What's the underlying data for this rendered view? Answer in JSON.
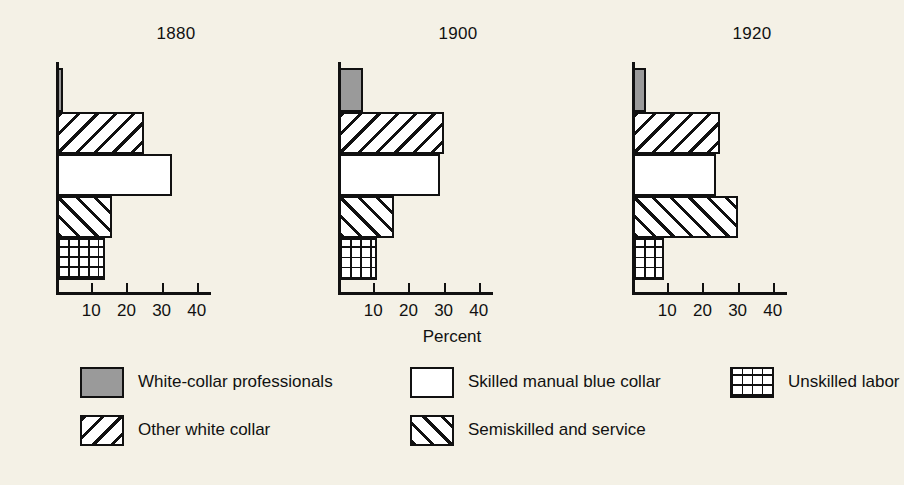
{
  "chart_data": {
    "type": "bar",
    "title": "",
    "xlabel": "Percent",
    "ylabel": "",
    "orientation": "horizontal",
    "grid": false,
    "legend_position": "bottom",
    "xlim": [
      0,
      45
    ],
    "xticks": [
      10,
      20,
      30,
      40
    ],
    "xtick_labels": [
      "10",
      "20",
      "30",
      "40"
    ],
    "panels": [
      "1880",
      "1900",
      "1920"
    ],
    "categories": [
      "White-collar professionals",
      "Other white collar",
      "Skilled manual blue collar",
      "Semiskilled and service",
      "Unskilled labor"
    ],
    "series": [
      {
        "name": "1880",
        "values": [
          2,
          25,
          33,
          16,
          14
        ]
      },
      {
        "name": "1900",
        "values": [
          7,
          30,
          29,
          16,
          11
        ]
      },
      {
        "name": "1920",
        "values": [
          4,
          25,
          24,
          30,
          9
        ]
      }
    ]
  },
  "panels": [
    {
      "title": "1880",
      "bars": [
        {
          "label": "White-collar professionals",
          "value": 2,
          "pattern": "solid-gray"
        },
        {
          "label": "Other white collar",
          "value": 25,
          "pattern": "backslash"
        },
        {
          "label": "Skilled manual blue collar",
          "value": 33,
          "pattern": "white"
        },
        {
          "label": "Semiskilled and service",
          "value": 16,
          "pattern": "forwardslash"
        },
        {
          "label": "Unskilled labor",
          "value": 14,
          "pattern": "grid"
        }
      ]
    },
    {
      "title": "1900",
      "bars": [
        {
          "label": "White-collar professionals",
          "value": 7,
          "pattern": "solid-gray"
        },
        {
          "label": "Other white collar",
          "value": 30,
          "pattern": "backslash"
        },
        {
          "label": "Skilled manual blue collar",
          "value": 29,
          "pattern": "white"
        },
        {
          "label": "Semiskilled and service",
          "value": 16,
          "pattern": "forwardslash"
        },
        {
          "label": "Unskilled labor",
          "value": 11,
          "pattern": "grid"
        }
      ]
    },
    {
      "title": "1920",
      "bars": [
        {
          "label": "White-collar professionals",
          "value": 4,
          "pattern": "solid-gray"
        },
        {
          "label": "Other white collar",
          "value": 25,
          "pattern": "backslash"
        },
        {
          "label": "Skilled manual blue collar",
          "value": 24,
          "pattern": "white"
        },
        {
          "label": "Semiskilled and service",
          "value": 30,
          "pattern": "forwardslash"
        },
        {
          "label": "Unskilled labor",
          "value": 9,
          "pattern": "grid"
        }
      ]
    }
  ],
  "axis": {
    "tick_values": [
      10,
      20,
      30,
      40
    ],
    "tick_labels": [
      "10",
      "20",
      "30",
      "40"
    ],
    "xlabel": "Percent"
  },
  "legend": {
    "rows": [
      [
        {
          "label": "White-collar professionals",
          "pattern": "solid-gray"
        },
        {
          "label": "Skilled manual blue collar",
          "pattern": "white"
        },
        {
          "label": "Unskilled labor",
          "pattern": "grid"
        }
      ],
      [
        {
          "label": "Other white collar",
          "pattern": "backslash"
        },
        {
          "label": "Semiskilled and service",
          "pattern": "forwardslash"
        }
      ]
    ]
  },
  "colors": {
    "background": "#f4f1e6",
    "ink": "#111111",
    "gray_fill": "#9a9a9a",
    "white_fill": "#ffffff"
  }
}
